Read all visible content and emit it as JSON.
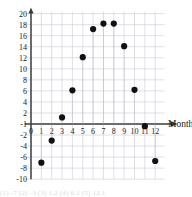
{
  "chart_data": {
    "type": "scatter",
    "title": "",
    "xlabel": "Month",
    "ylabel": "",
    "xlim": [
      -1,
      13
    ],
    "ylim": [
      -10,
      20
    ],
    "grid": true,
    "legend": "none",
    "x_ticks": [
      0,
      1,
      2,
      3,
      4,
      5,
      6,
      7,
      8,
      9,
      10,
      11,
      12
    ],
    "x_tick_labels": [
      "0",
      "1",
      "2",
      "3",
      "4",
      "5",
      "6",
      "7",
      "8",
      "9",
      "10",
      "11",
      "12"
    ],
    "y_ticks": [
      -10,
      -8,
      -6,
      -4,
      -2,
      2,
      4,
      6,
      8,
      10,
      12,
      14,
      16,
      18,
      20
    ],
    "y_tick_labels": [
      "-10",
      "-8",
      "-6",
      "-4",
      "-2",
      "2",
      "4",
      "6",
      "8",
      "10",
      "12",
      "14",
      "16",
      "18",
      "20"
    ],
    "y_axis_origin_label": "-1",
    "x": [
      1,
      2,
      3,
      4,
      5,
      6,
      7,
      8,
      9,
      10,
      11,
      12
    ],
    "values": [
      -7,
      -3,
      1.2,
      6.1,
      12.1,
      17.2,
      18.2,
      18.2,
      14.1,
      6.2,
      -0.4,
      -6.7
    ],
    "points": [
      {
        "x": 1,
        "y": -7
      },
      {
        "x": 2,
        "y": -3
      },
      {
        "x": 3,
        "y": 1.2
      },
      {
        "x": 4,
        "y": 6.1
      },
      {
        "x": 5,
        "y": 12.1
      },
      {
        "x": 6,
        "y": 17.2
      },
      {
        "x": 7,
        "y": 18.2
      },
      {
        "x": 8,
        "y": 18.2
      },
      {
        "x": 9,
        "y": 14.1
      },
      {
        "x": 10,
        "y": 6.2
      },
      {
        "x": 11,
        "y": -0.4
      },
      {
        "x": 12,
        "y": -6.7
      }
    ],
    "marker_color": "#111111",
    "grid_color": "#c9c9d6",
    "axis_color": "#3a3a3a",
    "note": "11 tick label obscured by data point"
  },
  "footer": {
    "clipped_text": "(1) -7 (2) -3 (3) 1.2 (4) 6.1 (5) 12.1"
  }
}
